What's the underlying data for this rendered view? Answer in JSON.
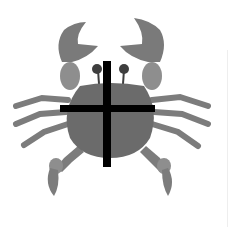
{
  "image": {
    "subject": "crab",
    "overlay": "cross",
    "colors": {
      "background": "#ffffff",
      "body": "#6b6b6b",
      "claw": "#7a7a7a",
      "claw_joint": "#8e8e8e",
      "legs": "#7c7c7c",
      "eyes": "#3e3e3e",
      "cross": "#000000"
    }
  }
}
